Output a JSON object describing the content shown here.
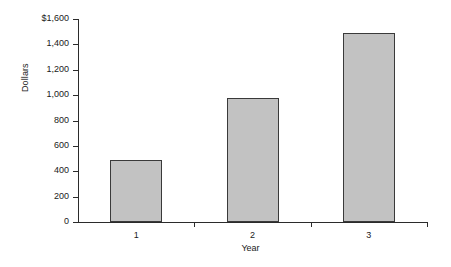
{
  "chart_data": {
    "type": "bar",
    "title": "",
    "xlabel": "Year",
    "ylabel": "Dollars",
    "categories": [
      "1",
      "2",
      "3"
    ],
    "values": [
      490,
      980,
      1490
    ],
    "ylim": [
      0,
      1600
    ],
    "yticks": [
      0,
      200,
      400,
      600,
      800,
      1000,
      1200,
      1400,
      1600
    ],
    "ytick_labels": [
      "0",
      "200",
      "400",
      "600",
      "800",
      "1,000",
      "1,200",
      "1,400",
      "$1,600"
    ],
    "grid": false,
    "legend": false,
    "bar_color": "#c2c2c2",
    "bar_border_color": "#3a3a3a",
    "axis_color": "#2b2b2b",
    "background_color": "#ffffff"
  }
}
